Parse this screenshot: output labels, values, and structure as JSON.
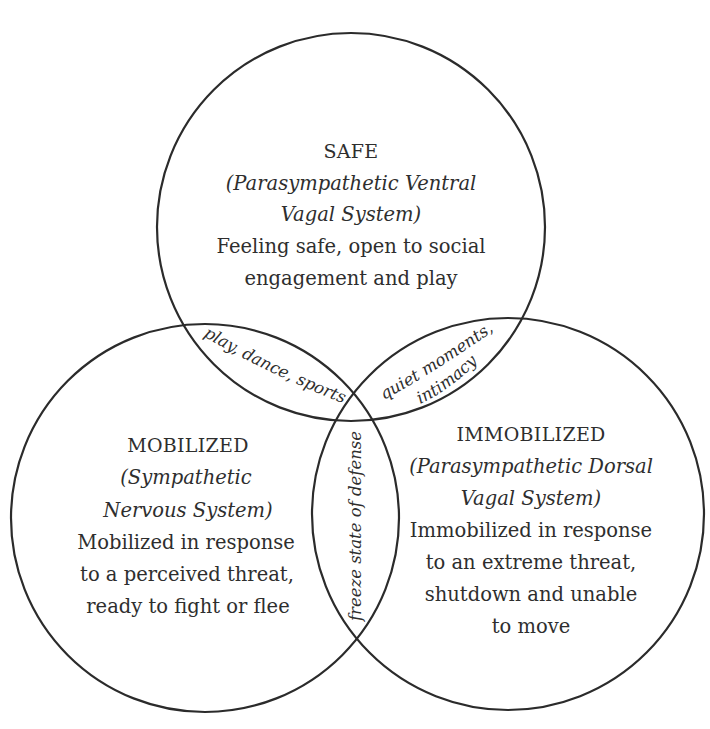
{
  "diagram": {
    "type": "venn",
    "stroke_color": "#2b2b2b",
    "text_color": "#2e2e2e",
    "circles": [
      {
        "id": "safe",
        "title": "SAFE",
        "subtitle_lines": [
          "(Parasympathetic Ventral",
          "Vagal System)"
        ],
        "description_lines": [
          "Feeling safe, open to social",
          "engagement and play"
        ]
      },
      {
        "id": "mobilized",
        "title": "MOBILIZED",
        "subtitle_lines": [
          "(Sympathetic",
          "Nervous System)"
        ],
        "description_lines": [
          "Mobilized in response",
          "to a perceived threat,",
          "ready to fight or flee"
        ]
      },
      {
        "id": "immobilized",
        "title": "IMMOBILIZED",
        "subtitle_lines": [
          "(Parasympathetic Dorsal",
          "Vagal System)"
        ],
        "description_lines": [
          "Immobilized in response",
          "to an extreme threat,",
          "shutdown and unable",
          "to move"
        ]
      }
    ],
    "overlaps": {
      "safe_mobilized": "play, dance, sports",
      "safe_immobilized_line1": "quiet moments,",
      "safe_immobilized_line2": "intimacy",
      "mobilized_immobilized": "freeze state of defense"
    }
  }
}
